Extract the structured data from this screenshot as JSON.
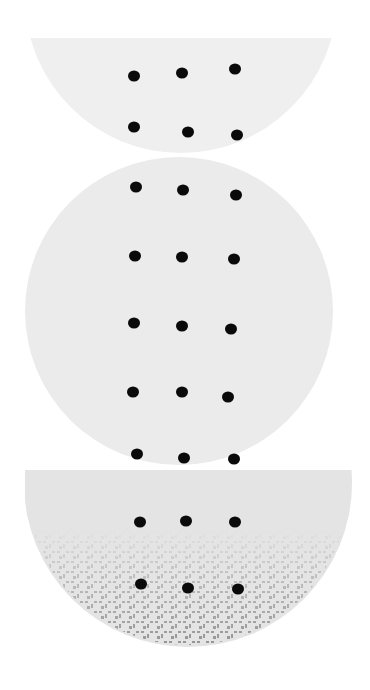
{
  "artwork": {
    "background": "#ffffff",
    "shapes": [
      {
        "name": "top-half-disc",
        "fill": "#efefef",
        "cx": 181,
        "cy": -3,
        "r": 156,
        "clip_top": 38,
        "dots": [
          [
            134,
            76
          ],
          [
            182,
            73
          ],
          [
            235,
            69
          ],
          [
            134,
            127
          ],
          [
            188,
            132
          ],
          [
            237,
            135
          ]
        ]
      },
      {
        "name": "middle-circle",
        "fill": "#ebebeb",
        "cx": 179,
        "cy": 311,
        "r": 154,
        "dots": [
          [
            136,
            187
          ],
          [
            183,
            190
          ],
          [
            236,
            195
          ],
          [
            135,
            256
          ],
          [
            182,
            257
          ],
          [
            234,
            259
          ],
          [
            134,
            323
          ],
          [
            182,
            326
          ],
          [
            231,
            329
          ],
          [
            133,
            392
          ],
          [
            182,
            392
          ],
          [
            228,
            397
          ],
          [
            137,
            454
          ],
          [
            184,
            458
          ],
          [
            234,
            459
          ]
        ]
      },
      {
        "name": "bottom-bowl",
        "fill": "#e4e4e4",
        "texture": "#8a8a8a",
        "cx": 188,
        "cy": 483,
        "r": 164,
        "clip_top": 470,
        "dots": [
          [
            140,
            522
          ],
          [
            186,
            521
          ],
          [
            235,
            522
          ],
          [
            141,
            584
          ],
          [
            188,
            588
          ],
          [
            238,
            589
          ]
        ]
      }
    ],
    "dot_color": "#0a0a0a"
  }
}
